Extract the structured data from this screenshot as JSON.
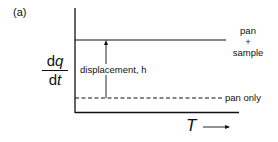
{
  "figure": {
    "panel_label": "(a)",
    "y_axis_label": {
      "numerator_prefix": "d",
      "numerator_var": "q",
      "denominator_prefix": "d",
      "denominator_var": "t"
    },
    "x_axis_label": "T",
    "lines": [
      {
        "name": "pan + sample",
        "style": "solid",
        "label_lines": [
          "pan",
          "+",
          "sample"
        ]
      },
      {
        "name": "pan only",
        "style": "dashed",
        "label": "pan only"
      }
    ],
    "annotation": "displacement, h"
  }
}
